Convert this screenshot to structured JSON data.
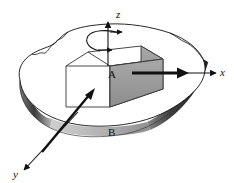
{
  "figure": {
    "type": "engineering-diagram",
    "background_color": "#ffffff",
    "line_color": "#111111",
    "axes": [
      {
        "id": "z",
        "label": "z",
        "direction": "up",
        "label_x": 116,
        "label_y": 15
      },
      {
        "id": "x",
        "label": "x",
        "direction": "right",
        "label_x": 223,
        "label_y": 74
      },
      {
        "id": "y",
        "label": "y",
        "direction": "down-left",
        "label_x": 17,
        "label_y": 177
      }
    ],
    "labels": [
      {
        "id": "A",
        "text": "A",
        "x": 112,
        "y": 74,
        "describes": "block on top surface"
      },
      {
        "id": "B",
        "text": "B",
        "x": 112,
        "y": 133,
        "describes": "supporting surface / plate"
      }
    ],
    "arrows": [
      {
        "id": "rotation-curl",
        "style": "curved-double-headed",
        "about": "z-axis",
        "meaning": "angular rotation about z"
      },
      {
        "id": "force-x",
        "style": "bold-straight",
        "direction": "right",
        "meaning": "force applied along x at block face"
      },
      {
        "id": "force-diagonal",
        "style": "bold-straight",
        "direction": "up-right",
        "meaning": "force applied on front face of block"
      }
    ],
    "colors": {
      "block_top_face": "#ffffff",
      "block_front_face": "#ffffff",
      "block_side_face": "#9e9e9e",
      "surface_fill": "#ffffff",
      "surface_edge_shadow_dark": "#2b2b2b",
      "surface_edge_shadow_light": "#d8d8d8",
      "outline": "#111111"
    }
  }
}
